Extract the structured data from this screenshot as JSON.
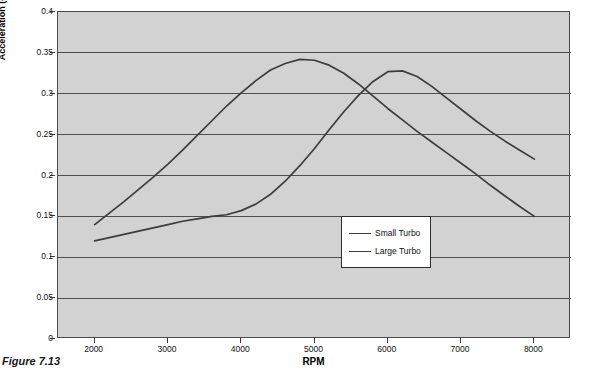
{
  "caption": "Figure 7.13",
  "chart_data": {
    "type": "line",
    "title": "",
    "subtitle": "",
    "xlabel": "RPM",
    "ylabel": "Acceleration (g in 3rd gear)",
    "xlim": [
      1500,
      8500
    ],
    "ylim": [
      0,
      0.4
    ],
    "xticks": [
      2000,
      3000,
      4000,
      5000,
      6000,
      7000,
      8000
    ],
    "xtick_labels": [
      "2000",
      "3000",
      "4000",
      "5000",
      "6000",
      "7000",
      "8000"
    ],
    "yticks": [
      0,
      0.05,
      0.1,
      0.15,
      0.2,
      0.25,
      0.3,
      0.35,
      0.4
    ],
    "ytick_labels": [
      "0",
      "0.05",
      "0.1",
      "0.15",
      "0.2",
      "0.25",
      "0.3",
      "0.35",
      "0.4"
    ],
    "grid": "horizontal",
    "legend_position": "center",
    "plot_background": "#d2d2d2",
    "line_color": "#3d3d3d",
    "series": [
      {
        "name": "Small Turbo",
        "color": "#3d3d3d",
        "x": [
          2000,
          2200,
          2400,
          2600,
          2800,
          3000,
          3200,
          3400,
          3600,
          3800,
          4000,
          4200,
          4400,
          4600,
          4800,
          5000,
          5200,
          5400,
          5600,
          5800,
          6000,
          6200,
          6400,
          6600,
          6800,
          7000,
          7200,
          7400,
          7600,
          7800,
          8000
        ],
        "y": [
          0.14,
          0.154,
          0.168,
          0.183,
          0.198,
          0.214,
          0.231,
          0.249,
          0.267,
          0.285,
          0.301,
          0.316,
          0.329,
          0.337,
          0.342,
          0.341,
          0.335,
          0.325,
          0.312,
          0.297,
          0.282,
          0.268,
          0.254,
          0.241,
          0.228,
          0.215,
          0.202,
          0.188,
          0.175,
          0.162,
          0.15
        ]
      },
      {
        "name": "Large Turbo",
        "color": "#3d3d3d",
        "x": [
          2000,
          2200,
          2400,
          2600,
          2800,
          3000,
          3200,
          3400,
          3600,
          3800,
          4000,
          4200,
          4400,
          4600,
          4800,
          5000,
          5200,
          5400,
          5600,
          5800,
          6000,
          6200,
          6400,
          6600,
          6800,
          7000,
          7200,
          7400,
          7600,
          7800,
          8000
        ],
        "y": [
          0.12,
          0.124,
          0.128,
          0.132,
          0.136,
          0.14,
          0.144,
          0.147,
          0.15,
          0.152,
          0.157,
          0.165,
          0.177,
          0.193,
          0.212,
          0.233,
          0.256,
          0.278,
          0.298,
          0.315,
          0.327,
          0.328,
          0.321,
          0.309,
          0.295,
          0.281,
          0.267,
          0.254,
          0.242,
          0.231,
          0.22
        ]
      }
    ]
  }
}
